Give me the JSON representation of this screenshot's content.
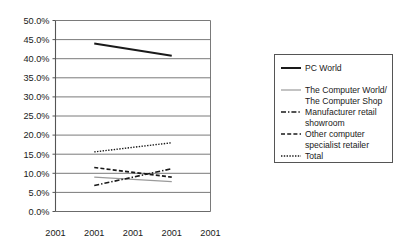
{
  "chart_data": {
    "type": "line",
    "title": "",
    "subtitle": "",
    "xlabel": "",
    "ylabel": "",
    "ylim": [
      0,
      50
    ],
    "ytick_labels": [
      "0.0%",
      "5.0%",
      "10.0%",
      "15.0%",
      "20.0%",
      "25.0%",
      "30.0%",
      "35.0%",
      "40.0%",
      "45.0%",
      "50.0%"
    ],
    "ytick_values": [
      0,
      5,
      10,
      15,
      20,
      25,
      30,
      35,
      40,
      45,
      50
    ],
    "categories": [
      "2001",
      "2001",
      "2001",
      "2001",
      "2001"
    ],
    "x_positions": [
      0,
      1,
      2,
      3,
      4
    ],
    "grid": "horizontal",
    "legend_position": "right",
    "series": [
      {
        "name": "PC World",
        "style": "solid",
        "color": "#1a1a1a",
        "width": 2.0,
        "x": [
          1,
          3
        ],
        "values": [
          44.0,
          40.8
        ]
      },
      {
        "name": "The Computer World/ The Computer Shop",
        "style": "solid",
        "color": "#9a9a9a",
        "width": 1.2,
        "x": [
          1,
          3
        ],
        "values": [
          9.0,
          7.8
        ]
      },
      {
        "name": "Manufacturer retail showroom",
        "style": "dashdot",
        "color": "#1a1a1a",
        "width": 1.6,
        "x": [
          1,
          3
        ],
        "values": [
          6.8,
          11.2
        ]
      },
      {
        "name": "Other computer specialist retailer",
        "style": "dashed",
        "color": "#1a1a1a",
        "width": 1.6,
        "x": [
          1,
          3
        ],
        "values": [
          11.5,
          9.0
        ]
      },
      {
        "name": "Total",
        "style": "dotted",
        "color": "#1a1a1a",
        "width": 1.4,
        "x": [
          1,
          3
        ],
        "values": [
          15.6,
          18.0
        ]
      }
    ]
  },
  "legend": {
    "entries": [
      {
        "label": "PC World",
        "label2": ""
      },
      {
        "label": "The Computer World/",
        "label2": "The Computer Shop"
      },
      {
        "label": "Manufacturer retail",
        "label2": "showroom"
      },
      {
        "label": "Other computer",
        "label2": "specialist retailer"
      },
      {
        "label": "Total",
        "label2": ""
      }
    ]
  },
  "axis": {
    "y_ticks": [
      "50.0%",
      "45.0%",
      "40.0%",
      "35.0%",
      "30.0%",
      "25.0%",
      "20.0%",
      "15.0%",
      "10.0%",
      "5.0%",
      "0.0%"
    ],
    "x_ticks": [
      "2001",
      "2001",
      "2001",
      "2001",
      "2001"
    ]
  },
  "colors": {
    "axis": "#555555",
    "grid": "#6b6b6b",
    "series_dark": "#1a1a1a",
    "series_gray": "#9a9a9a",
    "text": "#1a1a1a",
    "background": "#ffffff"
  }
}
